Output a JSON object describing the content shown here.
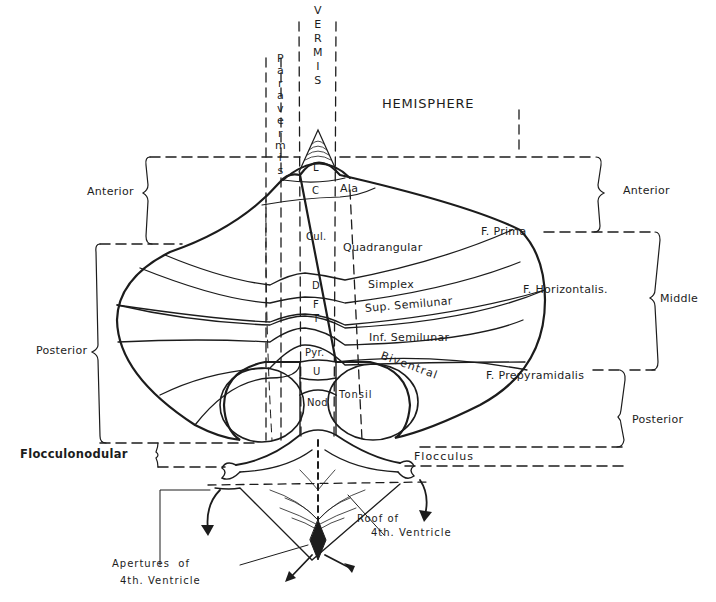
{
  "columns": {
    "vermis": [
      "V",
      "E",
      "R",
      "M",
      "I",
      "S"
    ],
    "paravermis": [
      "P",
      "a",
      "r",
      "a",
      "v",
      "e",
      "r",
      "m",
      "i",
      "s"
    ],
    "hemisphere": "HEMISPHERE"
  },
  "left_braces": {
    "anterior": "Anterior",
    "posterior": "Posterior",
    "flocculonodular": "Flocculonodular"
  },
  "right_braces": {
    "anterior": "Anterior",
    "middle": "Middle",
    "posterior": "Posterior"
  },
  "fissures": {
    "prima": "F. Prima",
    "horizontalis": "F. Horizontalis.",
    "prepyramidalis": "F. Prepyramidalis"
  },
  "vermis_lobules": {
    "lingula": "L",
    "central": "C",
    "culmen": "Cul.",
    "declive": "D",
    "folium": "F",
    "tuber": "T",
    "pyramis": "Pyr.",
    "uvula": "U",
    "nodulus": "Nod"
  },
  "hemisphere_lobules": {
    "ala": "Ala",
    "quadrangular": "Quadrangular",
    "simplex": "Simplex",
    "sup_semilunar": "Sup. Semilunar",
    "inf_semilunar": "Inf. Semilunar",
    "biventral": [
      "B",
      "i",
      "v",
      "e",
      "n",
      "t",
      "r",
      "a",
      "l"
    ],
    "tonsil": "Tonsil",
    "flocculus": "Flocculus"
  },
  "ventricle": {
    "roof_line1": "Roof of",
    "roof_line2": "4th. Ventricle",
    "apertures_line1": "Apertures  of",
    "apertures_line2": "4th. Ventricle"
  },
  "colors": {
    "ink": "#1c1c1c",
    "background": "#ffffff"
  }
}
